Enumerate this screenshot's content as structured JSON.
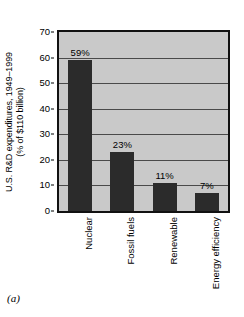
{
  "caption": "(a)",
  "axis": {
    "y_title_line1": "U.S. R&D expenditures, 1949–1999",
    "y_title_line2": "(% of $110 billion)"
  },
  "chart_data": {
    "type": "bar",
    "title": "",
    "xlabel": "",
    "ylabel": "U.S. R&D expenditures, 1949–1999 (% of $110 billion)",
    "ylim": [
      0,
      70
    ],
    "yticks": [
      0,
      10,
      20,
      30,
      40,
      50,
      60,
      70
    ],
    "ytick_labels": [
      "0",
      "10",
      "20",
      "30",
      "40",
      "50",
      "60",
      "70"
    ],
    "grid": true,
    "legend": "none",
    "categories": [
      "Nuclear",
      "Fossil fuels",
      "Renewable",
      "Energy efficiency"
    ],
    "values": [
      59,
      23,
      11,
      7
    ],
    "data_labels": [
      "59%",
      "23%",
      "11%",
      "7%"
    ],
    "colors": {
      "bar": "#2b2b2b",
      "plot_background": "#c9c9c9",
      "frame": "#111111",
      "gridline": "#4a4a4a",
      "page_background": "#ffffff",
      "text": "#000000"
    }
  }
}
